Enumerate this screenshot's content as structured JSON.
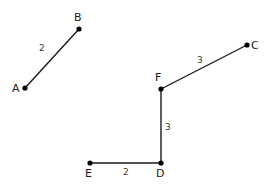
{
  "diagram": {
    "title": "Line segments with labeled lengths",
    "background_color": "#ffffff",
    "stroke_color": "#1a1a1a",
    "label_color": "#1a1a1a",
    "vertices": [
      {
        "id": "A",
        "label": "A",
        "x": 25,
        "y": 88,
        "label_x": 12,
        "label_y": 83
      },
      {
        "id": "B",
        "label": "B",
        "x": 79,
        "y": 29,
        "label_x": 74,
        "label_y": 12
      },
      {
        "id": "C",
        "label": "C",
        "x": 247,
        "y": 45,
        "label_x": 251,
        "label_y": 40
      },
      {
        "id": "F",
        "label": "F",
        "x": 161,
        "y": 89,
        "label_x": 155,
        "label_y": 72
      },
      {
        "id": "D",
        "label": "D",
        "x": 161,
        "y": 163,
        "label_x": 156,
        "label_y": 168
      },
      {
        "id": "E",
        "label": "E",
        "x": 90,
        "y": 163,
        "label_x": 85,
        "label_y": 168
      }
    ],
    "segments": [
      {
        "id": "AB",
        "from": "A",
        "to": "B",
        "length_label": "2",
        "label_x": 39,
        "label_y": 44
      },
      {
        "id": "FC",
        "from": "F",
        "to": "C",
        "length_label": "3",
        "label_x": 197,
        "label_y": 56
      },
      {
        "id": "FD",
        "from": "F",
        "to": "D",
        "length_label": "3",
        "label_x": 165,
        "label_y": 123
      },
      {
        "id": "ED",
        "from": "E",
        "to": "D",
        "length_label": "2",
        "label_x": 123,
        "label_y": 168
      }
    ]
  }
}
